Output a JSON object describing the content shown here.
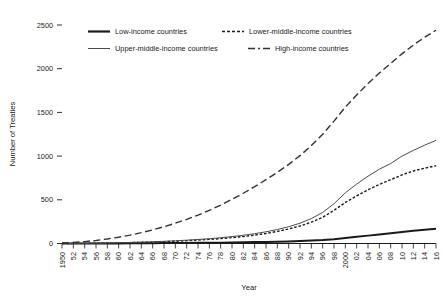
{
  "chart_data": {
    "type": "line",
    "title": "",
    "xlabel": "Year",
    "ylabel": "Number of Treaties",
    "xlim": [
      1950,
      2016
    ],
    "ylim": [
      0,
      2500
    ],
    "yticks": [
      0,
      500,
      1000,
      1500,
      2000,
      2500
    ],
    "ytick_labels": [
      "0",
      "500",
      "1000",
      "1500",
      "2000",
      "2500"
    ],
    "xticks": [
      1950,
      1952,
      1954,
      1956,
      1958,
      1960,
      1962,
      1964,
      1966,
      1968,
      1970,
      1972,
      1974,
      1976,
      1978,
      1980,
      1982,
      1984,
      1986,
      1988,
      1990,
      1992,
      1994,
      1996,
      1998,
      2000,
      2002,
      2004,
      2006,
      2008,
      2010,
      2012,
      2014,
      2016
    ],
    "xtick_labels": [
      "1950",
      "52",
      "54",
      "56",
      "58",
      "60",
      "62",
      "64",
      "66",
      "68",
      "70",
      "72",
      "74",
      "76",
      "78",
      "80",
      "82",
      "84",
      "86",
      "88",
      "90",
      "92",
      "94",
      "96",
      "98",
      "2000",
      "02",
      "04",
      "06",
      "08",
      "10",
      "12",
      "14",
      "16"
    ],
    "grid": false,
    "legend_position": "top",
    "x": [
      1950,
      1952,
      1954,
      1956,
      1958,
      1960,
      1962,
      1964,
      1966,
      1968,
      1970,
      1972,
      1974,
      1976,
      1978,
      1980,
      1982,
      1984,
      1986,
      1988,
      1990,
      1992,
      1994,
      1996,
      1998,
      2000,
      2002,
      2004,
      2006,
      2008,
      2010,
      2012,
      2014,
      2016
    ],
    "series": [
      {
        "name": "Low-income countries",
        "style": "solid-thick",
        "color": "#1a1a1a",
        "values": [
          0,
          0,
          0,
          0,
          1,
          1,
          2,
          3,
          4,
          5,
          6,
          7,
          8,
          9,
          10,
          12,
          14,
          16,
          18,
          21,
          24,
          28,
          33,
          39,
          48,
          62,
          76,
          90,
          104,
          118,
          132,
          146,
          158,
          170
        ]
      },
      {
        "name": "Lower-middle-income countries",
        "style": "dotted",
        "color": "#1a1a1a",
        "values": [
          0,
          1,
          2,
          3,
          5,
          7,
          10,
          13,
          17,
          21,
          26,
          32,
          39,
          47,
          56,
          67,
          80,
          96,
          115,
          138,
          166,
          200,
          244,
          300,
          380,
          470,
          545,
          615,
          675,
          730,
          785,
          830,
          862,
          890
        ]
      },
      {
        "name": "Upper-middle-income countries",
        "style": "solid-thin",
        "color": "#4d4d4d",
        "values": [
          0,
          1,
          2,
          4,
          6,
          9,
          12,
          16,
          20,
          25,
          31,
          38,
          46,
          55,
          66,
          79,
          94,
          112,
          134,
          160,
          192,
          232,
          285,
          355,
          455,
          580,
          680,
          770,
          850,
          915,
          1000,
          1065,
          1125,
          1180
        ]
      },
      {
        "name": "High-income countries",
        "style": "dashed-long",
        "color": "#333333",
        "values": [
          5,
          12,
          22,
          35,
          52,
          72,
          96,
          124,
          156,
          192,
          232,
          276,
          325,
          380,
          440,
          505,
          575,
          650,
          730,
          815,
          905,
          1005,
          1120,
          1250,
          1400,
          1560,
          1700,
          1830,
          1950,
          2060,
          2170,
          2270,
          2360,
          2440
        ]
      }
    ]
  },
  "legend": {
    "entries": [
      {
        "label": "Low-income countries"
      },
      {
        "label": "Lower-middle-income countries"
      },
      {
        "label": "Upper-middle-income countries"
      },
      {
        "label": "High-income countries"
      }
    ]
  }
}
